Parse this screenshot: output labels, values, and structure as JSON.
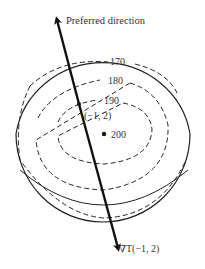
{
  "diagram": {
    "title_label": "Preferred direction",
    "gradient_label": "∇T(−1, 2)",
    "point_label": "(−1, 2)",
    "peak_label": "200",
    "contours": [
      {
        "level": "170",
        "label": "170"
      },
      {
        "level": "180",
        "label": "180"
      },
      {
        "level": "190",
        "label": "190"
      }
    ],
    "colors": {
      "stroke": "#222222",
      "text": "#333333",
      "background": "#ffffff"
    }
  }
}
